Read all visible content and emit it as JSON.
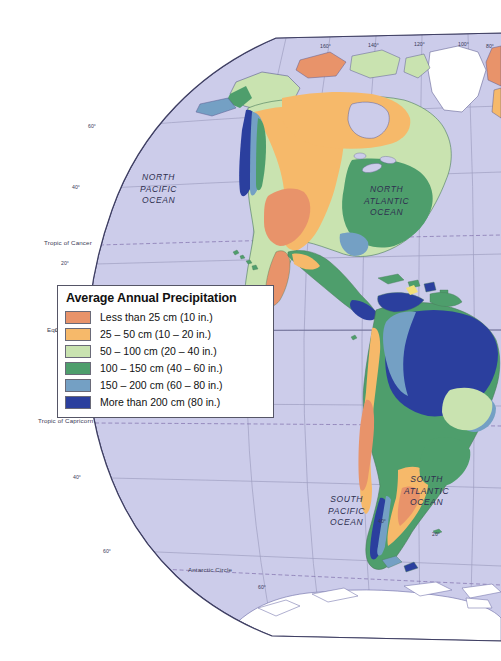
{
  "map": {
    "title": "Average Annual Precipitation",
    "projection": "globe-hemisphere",
    "background_color": "#ffffff",
    "ocean_color": "#ccccea",
    "graticule_color": "#8f8fb4",
    "coastline_color": "#4a4a78",
    "border_color": "#6e6e8c",
    "ice_color": "#ffffff"
  },
  "legend": {
    "title": "Average Annual Precipitation",
    "items": [
      {
        "color": "#e8936a",
        "label": "Less than 25 cm (10 in.)"
      },
      {
        "color": "#f6b96a",
        "label": "25 – 50 cm (10 – 20 in.)"
      },
      {
        "color": "#c9e3b0",
        "label": "50 – 100 cm (20 – 40 in.)"
      },
      {
        "color": "#4e9e6c",
        "label": "100 – 150 cm (40 – 60 in.)"
      },
      {
        "color": "#74a0c4",
        "label": "150 – 200 cm (60 – 80 in.)"
      },
      {
        "color": "#2b3f9e",
        "label": "More than 200 cm (80 in.)"
      }
    ]
  },
  "ocean_labels": [
    {
      "name": "north-pacific-ocean",
      "lines": [
        "NORTH",
        "PACIFIC",
        "OCEAN"
      ],
      "x": 152,
      "y": 178
    },
    {
      "name": "north-atlantic-ocean",
      "lines": [
        "NORTH",
        "ATLANTIC",
        "OCEAN"
      ],
      "x": 378,
      "y": 190
    },
    {
      "name": "south-pacific-ocean",
      "lines": [
        "SOUTH",
        "PACIFIC",
        "OCEAN"
      ],
      "x": 340,
      "y": 500
    },
    {
      "name": "south-atlantic-ocean",
      "lines": [
        "SOUTH",
        "ATLANTIC",
        "OCEAN"
      ],
      "x": 418,
      "y": 480
    }
  ],
  "reference_lines": [
    {
      "name": "tropic-of-cancer",
      "label": "Tropic of Cancer",
      "x": 44,
      "y": 239
    },
    {
      "name": "equator",
      "label": "Equator",
      "x": 47,
      "y": 327
    },
    {
      "name": "tropic-of-capricorn",
      "label": "Tropic of Capricorn",
      "x": 38,
      "y": 417
    },
    {
      "name": "antarctic-circle",
      "label": "Antarctic Circle",
      "x": 188,
      "y": 567
    }
  ],
  "latitude_labels": [
    {
      "value": "60°",
      "x": 88,
      "y": 126
    },
    {
      "value": "40°",
      "x": 72,
      "y": 184
    },
    {
      "value": "20°",
      "x": 61,
      "y": 262
    },
    {
      "value": "0°",
      "x": 57,
      "y": 330
    },
    {
      "value": "20°",
      "x": 60,
      "y": 404
    },
    {
      "value": "40°",
      "x": 73,
      "y": 477
    },
    {
      "value": "60°",
      "x": 103,
      "y": 551
    }
  ],
  "longitude_labels": [
    {
      "value": "160°",
      "x": 320,
      "y": 46
    },
    {
      "value": "140°",
      "x": 368,
      "y": 44
    },
    {
      "value": "120°",
      "x": 414,
      "y": 43
    },
    {
      "value": "100°",
      "x": 458,
      "y": 43
    },
    {
      "value": "80°",
      "x": 487,
      "y": 45
    }
  ],
  "interior_degree_labels": [
    {
      "value": "40°",
      "x": 378,
      "y": 520
    },
    {
      "value": "20°",
      "x": 432,
      "y": 533
    },
    {
      "value": "60°",
      "x": 260,
      "y": 586
    }
  ]
}
